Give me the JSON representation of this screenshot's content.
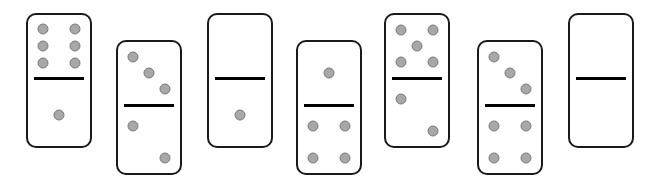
{
  "colors": {
    "background": "#ffffff",
    "border": "#1a1a1a",
    "divider": "#000000",
    "pip": "#a8a8a8"
  },
  "dominoes": [
    {
      "x": 26,
      "y": 13,
      "top": 6,
      "bottom": 1
    },
    {
      "x": 116,
      "y": 40,
      "top": 3,
      "bottom": 2
    },
    {
      "x": 207,
      "y": 13,
      "top": 0,
      "bottom": 1
    },
    {
      "x": 296,
      "y": 40,
      "top": 1,
      "bottom": 4
    },
    {
      "x": 384,
      "y": 13,
      "top": 5,
      "bottom": 2
    },
    {
      "x": 477,
      "y": 40,
      "top": 3,
      "bottom": 4
    },
    {
      "x": 568,
      "y": 13,
      "top": 0,
      "bottom": 0
    }
  ]
}
